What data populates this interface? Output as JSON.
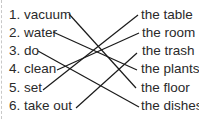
{
  "left_items": [
    {
      "label": "1. vacuum",
      "x": 9,
      "y": 7,
      "anchor": [
        69,
        14
      ]
    },
    {
      "label": "2. water",
      "x": 9,
      "y": 25,
      "anchor": [
        53,
        32
      ]
    },
    {
      "label": "3. do",
      "x": 9,
      "y": 43,
      "anchor": [
        38,
        51
      ]
    },
    {
      "label": "4. clean",
      "x": 9,
      "y": 61,
      "anchor": [
        57,
        70
      ]
    },
    {
      "label": "5. set",
      "x": 9,
      "y": 80,
      "anchor": [
        43,
        90
      ]
    },
    {
      "label": "6. take out",
      "x": 9,
      "y": 98,
      "anchor": [
        76,
        108
      ]
    }
  ],
  "right_items": [
    {
      "label": "the table",
      "x": 141,
      "y": 7,
      "anchor": [
        138,
        15
      ]
    },
    {
      "label": "the room",
      "x": 142,
      "y": 25,
      "anchor": [
        139,
        33
      ]
    },
    {
      "label": "the trash",
      "x": 142,
      "y": 43,
      "anchor": [
        137,
        53
      ]
    },
    {
      "label": "the plants",
      "x": 141,
      "y": 61,
      "anchor": [
        137,
        70
      ]
    },
    {
      "label": "the floor",
      "x": 141,
      "y": 80,
      "anchor": [
        136,
        88
      ]
    },
    {
      "label": "the dishes",
      "x": 141,
      "y": 98,
      "anchor": [
        139,
        107
      ]
    }
  ],
  "matches": [
    {
      "from": "1. vacuum",
      "to": "the floor"
    },
    {
      "from": "2. water",
      "to": "the plants"
    },
    {
      "from": "3. do",
      "to": "the dishes"
    },
    {
      "from": "4. clean",
      "to": "the room"
    },
    {
      "from": "5. set",
      "to": "the table"
    },
    {
      "from": "6. take out",
      "to": "the trash"
    }
  ],
  "colors": {
    "text": "#2a2a2a",
    "line": "#1a1a1a",
    "background": "#ffffff"
  }
}
